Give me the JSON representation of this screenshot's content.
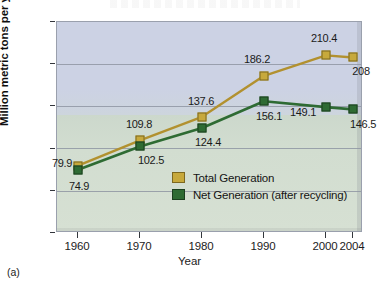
{
  "caption": "(a)",
  "chart_data": {
    "type": "line",
    "title": "",
    "xlabel": "Year",
    "ylabel": "Million metric tons per year",
    "categories": [
      "1960",
      "1970",
      "1980",
      "1990",
      "2000",
      "2004"
    ],
    "x": [
      1960,
      1970,
      1980,
      1990,
      2000,
      2004
    ],
    "series": [
      {
        "name": "Total Generation",
        "color": "#c7a93c",
        "values": [
          79.9,
          109.8,
          137.6,
          186.2,
          210.4,
          208
        ],
        "labels": [
          "79.9",
          "109.8",
          "137.6",
          "186.2",
          "210.4",
          "208"
        ]
      },
      {
        "name": "Net Generation (after recycling)",
        "color": "#2e6b33",
        "values": [
          74.9,
          102.5,
          124.4,
          156.1,
          149.1,
          146.5
        ],
        "labels": [
          "74.9",
          "102.5",
          "124.4",
          "156.1",
          "149.1",
          "146.5"
        ]
      }
    ],
    "yticks": [
      0,
      50,
      100,
      150,
      200,
      250
    ],
    "ytick_labels": [
      "0",
      "50",
      "100",
      "150",
      "200",
      "250"
    ],
    "ylim": [
      0,
      250
    ],
    "grid": true,
    "legend_position": "center",
    "legend": [
      "Total Generation",
      "Net Generation (after recycling)"
    ]
  },
  "axis": {
    "y_label": "Million metric tons per year",
    "x_label": "Year"
  },
  "colors": {
    "total": "#c7a93c",
    "net": "#2e6b33",
    "plot_upper_bg": "#ccd2e4",
    "plot_lower_bg": "#d2ddd0",
    "gridline": "#8f96a3"
  }
}
